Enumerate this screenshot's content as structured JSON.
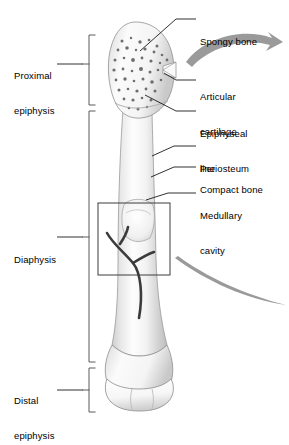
{
  "figure": {
    "background_color": "#ffffff",
    "width": 289,
    "height": 423
  },
  "colors": {
    "outline": "#6f6f6f",
    "leader_line": "#1a1a1a",
    "bracket": "#5a5a5a",
    "inset_box": "#3c3c3c",
    "arrow_gray": "#9a9a9a",
    "vessel_dark": "#3b3b3b",
    "bone_light": "#fbfbfb",
    "bone_shade": "#d3d3d3",
    "spongy_speckle": "#6b6b6b",
    "text": "#000000"
  },
  "region_labels": [
    {
      "id": "proximal-epiphysis",
      "line1": "Proximal",
      "line2": "epiphysis"
    },
    {
      "id": "diaphysis",
      "line1": "Diaphysis",
      "line2": ""
    },
    {
      "id": "distal-epiphysis",
      "line1": "Distal",
      "line2": "epiphysis"
    }
  ],
  "part_labels": [
    {
      "id": "spongy-bone",
      "line1": "Spongy bone",
      "line2": ""
    },
    {
      "id": "articular-cartilage",
      "line1": "Articular",
      "line2": "cartilage"
    },
    {
      "id": "epiphyseal-line",
      "line1": "Epiphyseal",
      "line2": "line"
    },
    {
      "id": "periosteum",
      "line1": "Periosteum",
      "line2": ""
    },
    {
      "id": "compact-bone",
      "line1": "Compact bone",
      "line2": ""
    },
    {
      "id": "medullary-cavity",
      "line1": "Medullary",
      "line2": "cavity"
    }
  ],
  "annotations": {
    "inset_box_present": true,
    "magnifier_arrows": 2,
    "blood_vessel_present": true
  }
}
